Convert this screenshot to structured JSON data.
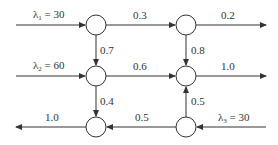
{
  "diagram": {
    "type": "queueing network",
    "colors": {
      "stroke": "#333333",
      "background": "#ffffff"
    },
    "nodes": [
      {
        "id": "n1",
        "row": 1,
        "col": 1
      },
      {
        "id": "n2",
        "row": 1,
        "col": 2
      },
      {
        "id": "n3",
        "row": 2,
        "col": 1
      },
      {
        "id": "n4",
        "row": 2,
        "col": 2
      },
      {
        "id": "n5",
        "row": 3,
        "col": 1
      },
      {
        "id": "n6",
        "row": 3,
        "col": 2
      }
    ],
    "arrivals": [
      {
        "symbol": "λ",
        "sub": "1",
        "eq": " = 30",
        "to": "n1"
      },
      {
        "symbol": "λ",
        "sub": "2",
        "eq": " = 60",
        "to": "n3"
      },
      {
        "symbol": "λ",
        "sub": "3",
        "eq": " = 30",
        "to": "n6"
      }
    ],
    "edges": [
      {
        "from": "n1",
        "to": "n2",
        "prob": "0.3"
      },
      {
        "from": "n2",
        "to": "exit",
        "prob": "0.2"
      },
      {
        "from": "n1",
        "to": "n3",
        "prob": "0.7"
      },
      {
        "from": "n2",
        "to": "n4",
        "prob": "0.8"
      },
      {
        "from": "n3",
        "to": "n4",
        "prob": "0.6"
      },
      {
        "from": "n4",
        "to": "exit",
        "prob": "1.0"
      },
      {
        "from": "n3",
        "to": "n5",
        "prob": "0.4"
      },
      {
        "from": "n6",
        "to": "n4",
        "prob": "0.5"
      },
      {
        "from": "n6",
        "to": "n5",
        "prob": "0.5"
      },
      {
        "from": "n5",
        "to": "exit",
        "prob": "1.0"
      }
    ]
  }
}
